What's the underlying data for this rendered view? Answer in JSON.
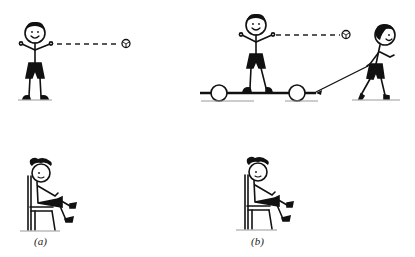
{
  "figure": {
    "panels": [
      {
        "id": "a",
        "label": "(a)",
        "scenes": [
          "boy standing on ground throwing ball",
          "girl sitting on chair"
        ]
      },
      {
        "id": "b",
        "label": "(b)",
        "scenes": [
          "boy standing on cart being pulled by another boy, throwing ball",
          "girl sitting on chair"
        ]
      }
    ]
  },
  "colors": {
    "ink": "#111111",
    "ground": "#888888",
    "background": "#ffffff"
  }
}
